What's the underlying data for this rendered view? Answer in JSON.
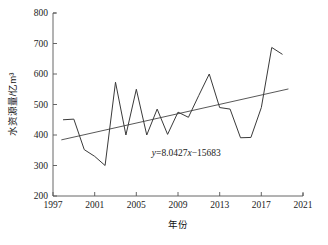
{
  "chart_data": {
    "type": "line",
    "title": "",
    "xlabel": "年份",
    "ylabel": "水资源量/亿m³",
    "xlim": [
      1997,
      2021
    ],
    "ylim": [
      200,
      800
    ],
    "xticks": [
      1997,
      2001,
      2005,
      2009,
      2013,
      2017,
      2021
    ],
    "yticks": [
      200,
      300,
      400,
      500,
      600,
      700,
      800
    ],
    "grid": false,
    "legend": null,
    "annotations": [
      {
        "name": "trend-equation",
        "text": "y=8.0427x−15683",
        "parts": {
          "y": "y",
          "eq": "=8.0427",
          "x": "x",
          "const": "−15683"
        },
        "x": 2009.8,
        "y": 330
      }
    ],
    "series": [
      {
        "name": "水资源量",
        "type": "line",
        "color": "#3a3a3a",
        "x": [
          1998,
          1999,
          2000,
          2001,
          2002,
          2003,
          2004,
          2005,
          2006,
          2007,
          2008,
          2009,
          2010,
          2011,
          2012,
          2013,
          2014,
          2015,
          2016,
          2017,
          2018,
          2019
        ],
        "values": [
          450,
          452,
          352,
          330,
          300,
          573,
          400,
          550,
          400,
          485,
          402,
          475,
          458,
          530,
          600,
          490,
          485,
          391,
          392,
          490,
          687,
          665
        ]
      },
      {
        "name": "线性趋势线",
        "type": "line",
        "color": "#3a3a3a",
        "equation": "y=8.0427x-15683",
        "slope": 8.0427,
        "intercept": -15683,
        "x": [
          1997.8,
          2019.6
        ],
        "values": [
          384,
          551
        ]
      }
    ]
  },
  "axes": {
    "x_tick_labels": [
      "1997",
      "2001",
      "2005",
      "2009",
      "2013",
      "2017",
      "2021"
    ],
    "y_tick_labels": [
      "200",
      "300",
      "400",
      "500",
      "600",
      "700",
      "800"
    ],
    "x_title": "年份",
    "y_title": "水资源量/亿m³"
  }
}
